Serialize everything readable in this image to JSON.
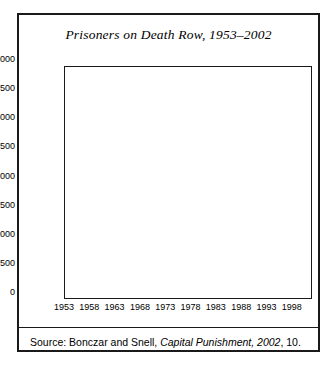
{
  "figure": {
    "title": "Prisoners on Death Row, 1953–2002",
    "source_prefix": "Source: Bonczar and Snell, ",
    "source_italic": "Capital Punishment, 2002",
    "source_suffix": ", 10."
  },
  "colors": {
    "area_fill": "#c8c8c8",
    "line": "#2a2a2a",
    "axis": "#1a1a1a",
    "gridline": "#000000",
    "background": "#ffffff"
  },
  "chart_data": {
    "type": "area",
    "title": "Prisoners on Death Row, 1953–2002",
    "xlabel": "",
    "ylabel": "",
    "xlim": [
      1953,
      2002
    ],
    "ylim": [
      0,
      4000
    ],
    "ytick_step": 500,
    "xtick_step": 5,
    "grid": "horizontal",
    "legend": "none",
    "yticks": [
      0,
      500,
      1000,
      1500,
      2000,
      2500,
      3000,
      3500,
      4000
    ],
    "ytick_labels": [
      "0",
      "500",
      "1000",
      "1500",
      "2000",
      "2500",
      "3000",
      "3500",
      "4000"
    ],
    "xticks": [
      1953,
      1958,
      1963,
      1968,
      1973,
      1978,
      1983,
      1988,
      1993,
      1998
    ],
    "xtick_labels": [
      "1953",
      "1958",
      "1963",
      "1968",
      "1973",
      "1978",
      "1983",
      "1988",
      "1993",
      "1998"
    ],
    "x": [
      1953,
      1954,
      1955,
      1956,
      1957,
      1958,
      1959,
      1960,
      1961,
      1962,
      1963,
      1964,
      1965,
      1966,
      1967,
      1968,
      1969,
      1970,
      1971,
      1972,
      1973,
      1974,
      1975,
      1976,
      1977,
      1978,
      1979,
      1980,
      1981,
      1982,
      1983,
      1984,
      1985,
      1986,
      1987,
      1988,
      1989,
      1990,
      1991,
      1992,
      1993,
      1994,
      1995,
      1996,
      1997,
      1998,
      1999,
      2000,
      2001,
      2002
    ],
    "values": [
      131,
      147,
      125,
      146,
      151,
      147,
      164,
      210,
      257,
      267,
      297,
      315,
      331,
      406,
      435,
      517,
      575,
      631,
      642,
      334,
      134,
      244,
      488,
      420,
      423,
      482,
      593,
      691,
      860,
      1066,
      1209,
      1420,
      1575,
      1800,
      1984,
      2124,
      2250,
      2356,
      2482,
      2575,
      2716,
      2890,
      3054,
      3219,
      3335,
      3452,
      3540,
      3593,
      3581,
      3557
    ],
    "series_name": "Prisoners on death row"
  }
}
